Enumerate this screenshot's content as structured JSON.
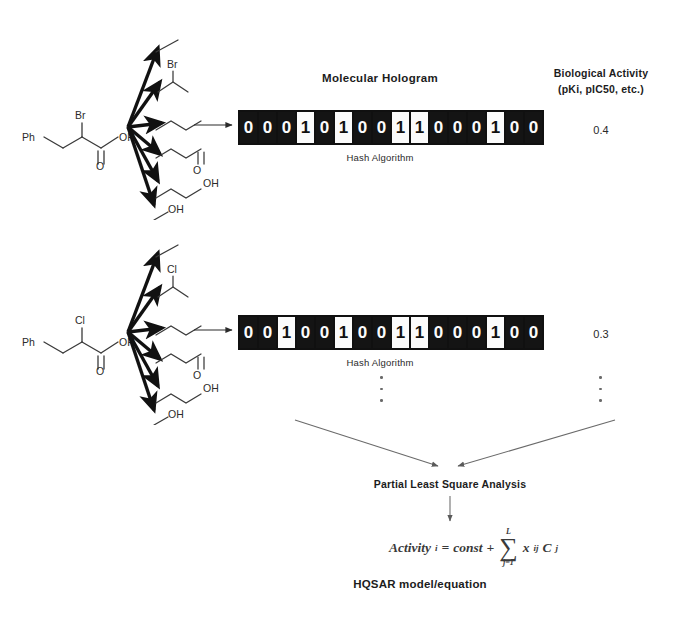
{
  "figure": {
    "hologram_title": "Molecular Hologram",
    "hash_label": "Hash Algorithm",
    "activity_heading_line1": "Biological Activity",
    "activity_heading_line2": "(pKi, pIC50, etc.)",
    "pls_label": "Partial Least Square Analysis",
    "hqsar_label": "HQSAR model/equation"
  },
  "equation": {
    "lhs": "Activity",
    "lhs_sub": "i",
    "equals": "=",
    "const": "const",
    "plus": "+",
    "sigma": "∑",
    "sigma_upper": "L",
    "sigma_lower": "j=1",
    "term_x": "x",
    "term_x_sub": "ij",
    "term_c": "C",
    "term_c_sub": "j",
    "full_text": "Activity_i = const + ∑(j=1..L) x_ij C_j"
  },
  "rows": [
    {
      "id": "row-1",
      "molecule": {
        "name": "2-bromo-3-phenylpropanoic acid",
        "ph_label": "Ph",
        "halogen_label": "Br",
        "oh_label": "OH",
        "carbonyl_label": "O"
      },
      "fragments": [
        {
          "id": "fragment-1",
          "label": "",
          "atoms": []
        },
        {
          "id": "fragment-2",
          "label": "Br",
          "atoms": [
            "Br"
          ]
        },
        {
          "id": "fragment-3",
          "label": "",
          "atoms": []
        },
        {
          "id": "fragment-4",
          "label": "O",
          "atoms": [
            "O"
          ]
        },
        {
          "id": "fragment-5",
          "label": "OH",
          "atoms": [
            "OH"
          ]
        },
        {
          "id": "fragment-6",
          "label": "OH",
          "atoms": [
            "OH"
          ]
        }
      ],
      "hologram_bits": [
        0,
        0,
        0,
        1,
        0,
        1,
        0,
        0,
        1,
        1,
        0,
        0,
        0,
        1,
        0,
        0
      ],
      "activity": "0.4"
    },
    {
      "id": "row-2",
      "molecule": {
        "name": "2-chloro-3-phenylpropanoic acid",
        "ph_label": "Ph",
        "halogen_label": "Cl",
        "oh_label": "OH",
        "carbonyl_label": "O"
      },
      "fragments": [
        {
          "id": "fragment-1",
          "label": "",
          "atoms": []
        },
        {
          "id": "fragment-2",
          "label": "Cl",
          "atoms": [
            "Cl"
          ]
        },
        {
          "id": "fragment-3",
          "label": "",
          "atoms": []
        },
        {
          "id": "fragment-4",
          "label": "O",
          "atoms": [
            "O"
          ]
        },
        {
          "id": "fragment-5",
          "label": "OH",
          "atoms": [
            "OH"
          ]
        },
        {
          "id": "fragment-6",
          "label": "OH",
          "atoms": [
            "OH"
          ]
        }
      ],
      "hologram_bits": [
        0,
        0,
        1,
        0,
        0,
        1,
        0,
        0,
        1,
        1,
        0,
        0,
        0,
        1,
        0,
        0
      ],
      "activity": "0.3"
    }
  ],
  "ellipsis": {
    "strip_dots": 3,
    "activity_dots": 3
  },
  "colors": {
    "background": "#ffffff",
    "bit_on_bg": "#fbfbfb",
    "bit_off_bg": "#141414",
    "text": "#1a1a1a",
    "structure_line": "#3a3a3a",
    "arrow_bold": "#111111",
    "arrow_thin": "#6a6a6a"
  }
}
